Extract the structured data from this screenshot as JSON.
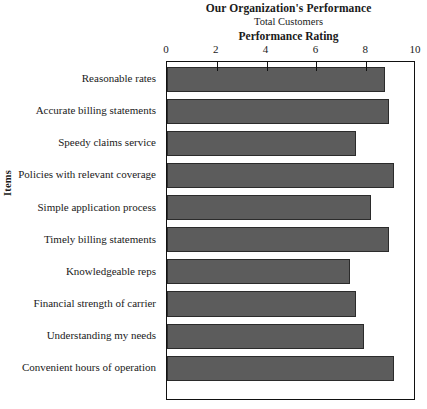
{
  "chart_data": {
    "type": "bar",
    "orientation": "horizontal",
    "title": "Our Organization's Performance",
    "subtitle": "Total Customers",
    "xlabel": "Performance Rating",
    "ylabel": "Items",
    "xlim": [
      0,
      10
    ],
    "xticks": [
      0,
      2,
      4,
      6,
      8,
      10
    ],
    "xtick_labels": [
      "0",
      "2",
      "4",
      "6",
      "8",
      "10"
    ],
    "grid": false,
    "legend": null,
    "bar_color": "#5c5c5c",
    "bar_edge_color": "#2b2b2b",
    "frame_color": "#111111",
    "categories": [
      "Reasonable rates",
      "Accurate billing statements",
      "Speedy claims service",
      "Policies with relevant coverage",
      "Simple application process",
      "Timely billing statements",
      "Knowledgeable reps",
      "Financial strength of carrier",
      "Understanding  my needs",
      "Convenient hours of operation"
    ],
    "values": [
      8.75,
      8.9,
      7.6,
      9.1,
      8.2,
      8.9,
      7.35,
      7.6,
      7.9,
      9.1
    ]
  }
}
